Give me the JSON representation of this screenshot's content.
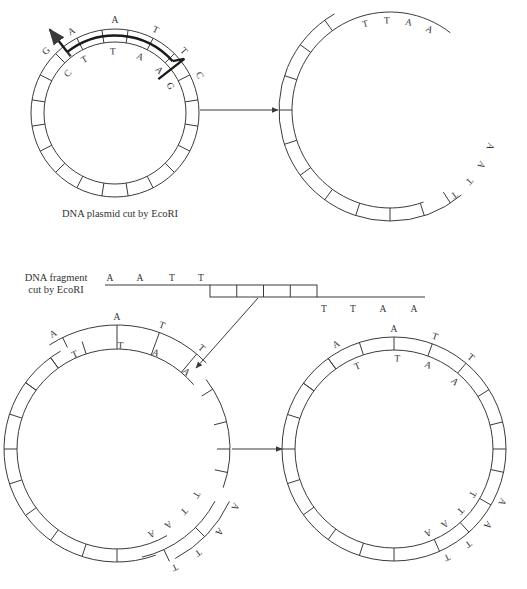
{
  "figure": {
    "stroke_color": "#3a3a3a",
    "background": "#ffffff",
    "caption_top": "DNA plasmid cut by EcoRI",
    "fragment_label_line1": "DNA fragment",
    "fragment_label_line2": "cut by EcoRI"
  },
  "panels": {
    "plasmid_intact": {
      "center": [
        115,
        113
      ],
      "r_outer": 84,
      "r_inner": 71,
      "segments": 20,
      "outer_letters": [
        "G",
        "A",
        "A",
        "T",
        "T",
        "C"
      ],
      "inner_letters": [
        "C",
        "T",
        "T",
        "A",
        "A",
        "G"
      ],
      "cut_marker": "staggered-cut-arrow"
    },
    "plasmid_cut": {
      "center": [
        390,
        110
      ],
      "r_outer": 111,
      "r_inner": 98,
      "top_end_letters": [
        "T",
        "T",
        "A",
        "A"
      ],
      "bottom_end_letters": [
        "T",
        "T",
        "A",
        "A"
      ]
    },
    "fragment": {
      "top_strand_letters": [
        "A",
        "A",
        "T",
        "T"
      ],
      "bottom_strand_letters": [
        "T",
        "T",
        "A",
        "A"
      ],
      "box_count": 4
    },
    "insertion": {
      "center": [
        117,
        449
      ],
      "r_outer": 113,
      "r_inner": 100,
      "top_outer_letters": [
        "A",
        "A",
        "T",
        "T"
      ],
      "top_inner_letters": [
        "T",
        "T",
        "A",
        "A"
      ],
      "bottom_inner_letters": [
        "A",
        "A",
        "T",
        "T"
      ],
      "bottom_outer_letters": [
        "T",
        "T",
        "A",
        "A"
      ]
    },
    "recombinant": {
      "center": [
        394,
        449
      ],
      "r_outer": 112,
      "r_inner": 99,
      "top_outer_letters": [
        "A",
        "A",
        "T",
        "T"
      ],
      "top_inner_letters": [
        "T",
        "T",
        "A",
        "A"
      ],
      "bottom_inner_letters": [
        "A",
        "A",
        "T",
        "T"
      ],
      "bottom_outer_letters": [
        "T",
        "T",
        "A",
        "A"
      ]
    }
  },
  "arrows": [
    {
      "name": "arrow-cut-to-open",
      "from": [
        200,
        110
      ],
      "to": [
        278,
        110
      ]
    },
    {
      "name": "arrow-fragment-to-plasmid",
      "from": [
        258,
        298
      ],
      "to": [
        196,
        368
      ]
    },
    {
      "name": "arrow-insert-to-recombinant",
      "from": [
        232,
        449
      ],
      "to": [
        282,
        449
      ]
    }
  ]
}
